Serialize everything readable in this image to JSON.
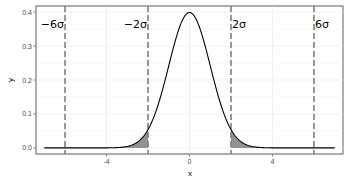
{
  "chart_data": {
    "type": "line",
    "title": "",
    "xlabel": "x",
    "ylabel": "y",
    "xlim": [
      -7.4,
      7.4
    ],
    "ylim": [
      -0.018,
      0.418
    ],
    "x_ticks": [
      -4,
      0,
      4
    ],
    "x_tick_labels": [
      "-4",
      "0",
      "4"
    ],
    "y_ticks": [
      0.0,
      0.1,
      0.2,
      0.3,
      0.4
    ],
    "y_tick_labels": [
      "0.0",
      "0.1",
      "0.2",
      "0.3",
      "0.4"
    ],
    "grid": true,
    "curve": {
      "name": "normal density (mean 0, sd 1)",
      "x_range": [
        -7,
        7
      ],
      "peak": {
        "x": 0,
        "y": 0.3989
      },
      "color": "#000000"
    },
    "shaded_regions": [
      {
        "from": -7,
        "to": -2,
        "fill": "#7f7f7f"
      },
      {
        "from": 2,
        "to": 7,
        "fill": "#7f7f7f"
      }
    ],
    "reference_lines": [
      {
        "x": -6,
        "label": "−6σ",
        "style": "dashed",
        "color": "#7f7f7f"
      },
      {
        "x": -2,
        "label": "−2σ",
        "style": "dashed",
        "color": "#7f7f7f"
      },
      {
        "x": 2,
        "label": "2σ",
        "style": "dashed",
        "color": "#7f7f7f"
      },
      {
        "x": 6,
        "label": "6σ",
        "style": "dashed",
        "color": "#7f7f7f"
      }
    ],
    "legend": null
  },
  "labels": {
    "xlabel": "x",
    "ylabel": "y",
    "x_ticks": [
      "-4",
      "0",
      "4"
    ],
    "y_ticks": [
      "0.0",
      "0.1",
      "0.2",
      "0.3",
      "0.4"
    ],
    "ref_labels": [
      "−6σ",
      "−2σ",
      "2σ",
      "6σ"
    ]
  }
}
